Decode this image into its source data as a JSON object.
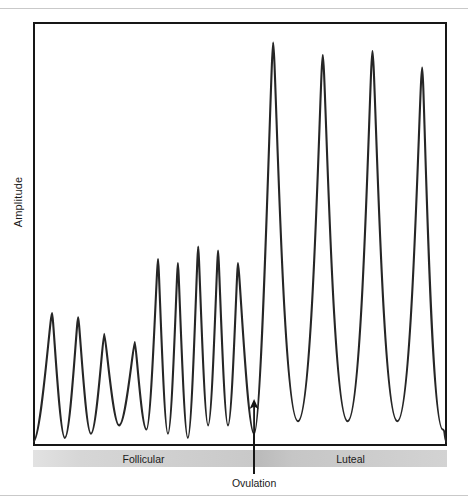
{
  "figure": {
    "y_axis_label": "Amplitude",
    "annotation_label": "Ovulation",
    "phases": [
      {
        "name": "Follicular"
      },
      {
        "name": "Luteal"
      }
    ]
  },
  "colors": {
    "curve": "#262626",
    "frame": "#161616",
    "band_follicular_start": "#e2e2e2",
    "band_follicular_end": "#c9c9c9",
    "band_luteal_start": "#b9b9b9",
    "band_luteal_end": "#d3d3d3",
    "rule": "#c9c9c9",
    "background": "#ffffff"
  },
  "chart_data": {
    "type": "line",
    "title": "",
    "xlabel": "",
    "ylabel": "Amplitude",
    "grid": false,
    "legend_position": "none",
    "axis_ticks": {
      "x": [],
      "y": []
    },
    "xlim": [
      0,
      100
    ],
    "ylim": [
      0,
      100
    ],
    "annotations": [
      {
        "label": "Ovulation",
        "x": 53.4,
        "type": "arrow-up"
      }
    ],
    "phase_bands": [
      {
        "label": "Follicular",
        "x_start": 0,
        "x_end": 53.4
      },
      {
        "label": "Luteal",
        "x_start": 53.4,
        "x_end": 100
      }
    ],
    "peaks": [
      {
        "phase": "Follicular",
        "index": 1,
        "x": 4.6,
        "amplitude": 31
      },
      {
        "phase": "Follicular",
        "index": 2,
        "x": 10.9,
        "amplitude": 30
      },
      {
        "phase": "Follicular",
        "index": 3,
        "x": 17.2,
        "amplitude": 26
      },
      {
        "phase": "Follicular",
        "index": 4,
        "x": 24.6,
        "amplitude": 24
      },
      {
        "phase": "Follicular",
        "index": 5,
        "x": 30.2,
        "amplitude": 44
      },
      {
        "phase": "Follicular",
        "index": 6,
        "x": 35.0,
        "amplitude": 43
      },
      {
        "phase": "Follicular",
        "index": 7,
        "x": 39.9,
        "amplitude": 47
      },
      {
        "phase": "Follicular",
        "index": 8,
        "x": 44.7,
        "amplitude": 46
      },
      {
        "phase": "Follicular",
        "index": 9,
        "x": 49.5,
        "amplitude": 43
      },
      {
        "phase": "Luteal",
        "index": 10,
        "x": 58.0,
        "amplitude": 96
      },
      {
        "phase": "Luteal",
        "index": 11,
        "x": 70.0,
        "amplitude": 93
      },
      {
        "phase": "Luteal",
        "index": 12,
        "x": 82.0,
        "amplitude": 94
      },
      {
        "phase": "Luteal",
        "index": 13,
        "x": 94.0,
        "amplitude": 90
      }
    ],
    "troughs": [
      {
        "phase": "Follicular",
        "x": 7.7,
        "amplitude": 1
      },
      {
        "phase": "Follicular",
        "x": 14.0,
        "amplitude": 2
      },
      {
        "phase": "Follicular",
        "x": 20.8,
        "amplitude": 4
      },
      {
        "phase": "Follicular",
        "x": 27.4,
        "amplitude": 3
      },
      {
        "phase": "Follicular",
        "x": 32.6,
        "amplitude": 2
      },
      {
        "phase": "Follicular",
        "x": 37.4,
        "amplitude": 1
      },
      {
        "phase": "Follicular",
        "x": 42.3,
        "amplitude": 4
      },
      {
        "phase": "Follicular",
        "x": 47.1,
        "amplitude": 4
      },
      {
        "phase": "Ovulation",
        "x": 53.4,
        "amplitude": 2
      },
      {
        "phase": "Luteal",
        "x": 64.0,
        "amplitude": 5
      },
      {
        "phase": "Luteal",
        "x": 76.0,
        "amplitude": 5
      },
      {
        "phase": "Luteal",
        "x": 88.0,
        "amplitude": 5
      },
      {
        "phase": "Luteal",
        "x": 99.0,
        "amplitude": 3
      }
    ]
  }
}
